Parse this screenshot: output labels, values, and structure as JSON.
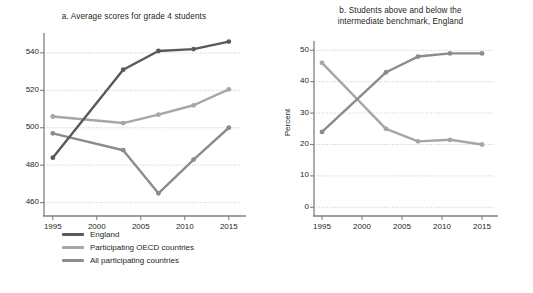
{
  "figure": {
    "background": "#ffffff",
    "text_color": "#231f20"
  },
  "colors": {
    "england": "#595959",
    "oecd": "#a6a6a6",
    "all_participating": "#8c8c8c",
    "above_benchmark": "#8c8c8c",
    "below_benchmark": "#a6a6a6",
    "axis": "#808080",
    "grid": "#b9b9c9"
  },
  "panel_a": {
    "title": "a. Average scores for grade 4 students",
    "ylabel": "Score",
    "yticks": [
      "540",
      "520",
      "500",
      "480",
      "460"
    ],
    "xticks": [
      "1995",
      "2000",
      "2005",
      "2010",
      "2015"
    ],
    "legend": [
      {
        "label": "England",
        "color": "#595959"
      },
      {
        "label": "Participating OECD countries",
        "color": "#a6a6a6"
      },
      {
        "label": "All participating countries",
        "color": "#8c8c8c"
      }
    ]
  },
  "panel_b": {
    "title_line1": "b. Students above and below the",
    "title_line2": "intermediate benchmark, England",
    "ylabel": "Percent",
    "yticks": [
      "50",
      "40",
      "30",
      "20",
      "10",
      "0"
    ],
    "xticks": [
      "1995",
      "2000",
      "2005",
      "2010",
      "2015"
    ],
    "legend": [
      {
        "label": "Above intermediate benchmark",
        "color": "#8c8c8c"
      },
      {
        "label": "Below intermediate benchmark",
        "color": "#a6a6a6"
      }
    ]
  },
  "chart_data": [
    {
      "type": "line",
      "id": "panel-a",
      "title": "a. Average scores for grade 4 students",
      "xlabel": "",
      "ylabel": "Score",
      "x": [
        1995,
        2003,
        2007,
        2011,
        2015
      ],
      "xlim": [
        1994,
        2016.5
      ],
      "ylim": [
        455,
        549
      ],
      "yticks": [
        460,
        480,
        500,
        520,
        540
      ],
      "xticks": [
        1995,
        2000,
        2005,
        2010,
        2015
      ],
      "grid": "horizontal-dotted",
      "markers": true,
      "legend_position": "below",
      "series": [
        {
          "name": "England",
          "color": "#595959",
          "values": [
            484,
            531,
            541,
            542,
            546
          ]
        },
        {
          "name": "Participating OECD countries",
          "color": "#a6a6a6",
          "values": [
            506,
            502.5,
            507,
            512,
            520.5
          ]
        },
        {
          "name": "All participating countries",
          "color": "#8c8c8c",
          "values": [
            497,
            488,
            465,
            483,
            500
          ]
        }
      ]
    },
    {
      "type": "line",
      "id": "panel-b",
      "title": "b. Students above and below the intermediate benchmark, England",
      "xlabel": "",
      "ylabel": "Percent",
      "x": [
        1995,
        2003,
        2007,
        2011,
        2015
      ],
      "xlim": [
        1994,
        2016.5
      ],
      "ylim": [
        -1.5,
        52
      ],
      "yticks": [
        0,
        10,
        20,
        30,
        40,
        50
      ],
      "xticks": [
        1995,
        2000,
        2005,
        2010,
        2015
      ],
      "grid": "horizontal-dotted",
      "markers": true,
      "legend_position": "below",
      "series": [
        {
          "name": "Above intermediate benchmark",
          "color": "#8c8c8c",
          "values": [
            24,
            43,
            48,
            49,
            49
          ]
        },
        {
          "name": "Below intermediate benchmark",
          "color": "#a6a6a6",
          "values": [
            46,
            25,
            21,
            21.5,
            20
          ]
        }
      ]
    }
  ]
}
